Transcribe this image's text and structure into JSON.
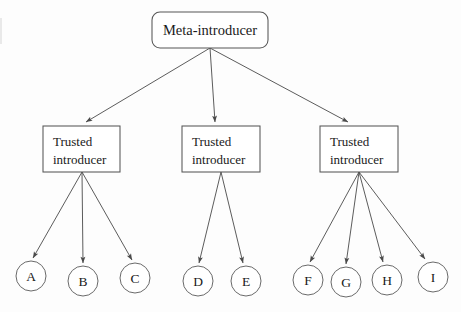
{
  "diagram": {
    "background_color": "#fdfdfd",
    "line_color": "#4a4a4a",
    "text_color": "#1a1a1a",
    "root": {
      "id": "meta-introducer",
      "label": "Meta-introducer",
      "shape": "rounded-rectangle",
      "x": 152,
      "y": 12,
      "width": 116,
      "height": 36,
      "anchor_x": 210,
      "anchor_y": 48
    },
    "introducers": [
      {
        "id": "trusted-introducer-1",
        "label_line1": "Trusted",
        "label_line2": "introducer",
        "shape": "rectangle",
        "x": 43,
        "y": 126,
        "width": 77,
        "height": 46,
        "anchor_x": 82,
        "anchor_y": 172,
        "children": [
          "A",
          "B",
          "C"
        ]
      },
      {
        "id": "trusted-introducer-2",
        "label_line1": "Trusted",
        "label_line2": "introducer",
        "shape": "rectangle",
        "x": 182,
        "y": 126,
        "width": 78,
        "height": 46,
        "anchor_x": 221,
        "anchor_y": 172,
        "children": [
          "D",
          "E"
        ]
      },
      {
        "id": "trusted-introducer-3",
        "label_line1": "Trusted",
        "label_line2": "introducer",
        "shape": "rectangle",
        "x": 320,
        "y": 126,
        "width": 78,
        "height": 46,
        "anchor_x": 359,
        "anchor_y": 172,
        "children": [
          "F",
          "G",
          "H",
          "I"
        ]
      }
    ],
    "leaves": [
      {
        "id": "leaf-a",
        "label": "A",
        "cx": 31,
        "cy": 276,
        "r": 15
      },
      {
        "id": "leaf-b",
        "label": "B",
        "cx": 83,
        "cy": 281,
        "r": 15
      },
      {
        "id": "leaf-c",
        "label": "C",
        "cx": 135,
        "cy": 278,
        "r": 15
      },
      {
        "id": "leaf-d",
        "label": "D",
        "cx": 198,
        "cy": 281,
        "r": 15
      },
      {
        "id": "leaf-e",
        "label": "E",
        "cx": 246,
        "cy": 281,
        "r": 15
      },
      {
        "id": "leaf-f",
        "label": "F",
        "cx": 308,
        "cy": 280,
        "r": 15
      },
      {
        "id": "leaf-g",
        "label": "G",
        "cx": 346,
        "cy": 282,
        "r": 15
      },
      {
        "id": "leaf-h",
        "label": "H",
        "cx": 387,
        "cy": 280,
        "r": 15
      },
      {
        "id": "leaf-i",
        "label": "I",
        "cx": 433,
        "cy": 277,
        "r": 15
      }
    ],
    "edges": [
      {
        "id": "edge-meta-ti1",
        "from": "meta-introducer",
        "to": "trusted-introducer-1",
        "x1": 210,
        "y1": 48,
        "x2": 86,
        "y2": 122
      },
      {
        "id": "edge-meta-ti2",
        "from": "meta-introducer",
        "to": "trusted-introducer-2",
        "x1": 210,
        "y1": 48,
        "x2": 215,
        "y2": 122
      },
      {
        "id": "edge-meta-ti3",
        "from": "meta-introducer",
        "to": "trusted-introducer-3",
        "x1": 210,
        "y1": 48,
        "x2": 348,
        "y2": 122
      },
      {
        "id": "edge-ti1-a",
        "from": "trusted-introducer-1",
        "to": "leaf-a",
        "x1": 82,
        "y1": 172,
        "x2": 33,
        "y2": 258
      },
      {
        "id": "edge-ti1-b",
        "from": "trusted-introducer-1",
        "to": "leaf-b",
        "x1": 82,
        "y1": 172,
        "x2": 83,
        "y2": 263
      },
      {
        "id": "edge-ti1-c",
        "from": "trusted-introducer-1",
        "to": "leaf-c",
        "x1": 82,
        "y1": 172,
        "x2": 132,
        "y2": 260
      },
      {
        "id": "edge-ti2-d",
        "from": "trusted-introducer-2",
        "to": "leaf-d",
        "x1": 221,
        "y1": 172,
        "x2": 199,
        "y2": 263
      },
      {
        "id": "edge-ti2-e",
        "from": "trusted-introducer-2",
        "to": "leaf-e",
        "x1": 221,
        "y1": 172,
        "x2": 243,
        "y2": 263
      },
      {
        "id": "edge-ti3-f",
        "from": "trusted-introducer-3",
        "to": "leaf-f",
        "x1": 359,
        "y1": 172,
        "x2": 310,
        "y2": 262
      },
      {
        "id": "edge-ti3-g",
        "from": "trusted-introducer-3",
        "to": "leaf-g",
        "x1": 359,
        "y1": 172,
        "x2": 346,
        "y2": 264
      },
      {
        "id": "edge-ti3-h",
        "from": "trusted-introducer-3",
        "to": "leaf-h",
        "x1": 359,
        "y1": 172,
        "x2": 383,
        "y2": 262
      },
      {
        "id": "edge-ti3-i",
        "from": "trusted-introducer-3",
        "to": "leaf-i",
        "x1": 359,
        "y1": 172,
        "x2": 425,
        "y2": 259
      }
    ]
  }
}
